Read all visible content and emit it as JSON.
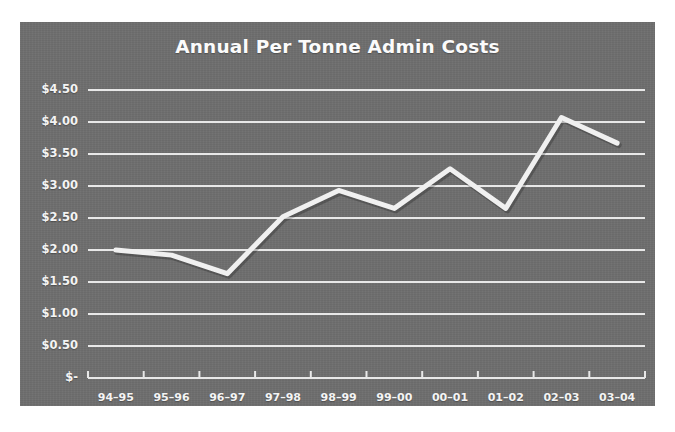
{
  "figure": {
    "background_color": "#ffffff",
    "panel_color": "#6f6f6f",
    "line_color": "#f0f0f0",
    "grid_color": "#e8e8e8",
    "text_color": "#f4f4f4"
  },
  "chart_data": {
    "type": "line",
    "title": "Annual Per Tonne Admin Costs",
    "xlabel": "",
    "ylabel": "",
    "categories": [
      "94–95",
      "95–96",
      "96–97",
      "97–98",
      "98–99",
      "99–00",
      "00–01",
      "01–02",
      "02–03",
      "03–04"
    ],
    "values": [
      2.0,
      1.92,
      1.63,
      2.52,
      2.93,
      2.65,
      3.27,
      2.65,
      4.07,
      3.67
    ],
    "series": [
      {
        "name": "Annual Per Tonne Admin Costs",
        "values": [
          2.0,
          1.92,
          1.63,
          2.52,
          2.93,
          2.65,
          3.27,
          2.65,
          4.07,
          3.67
        ]
      }
    ],
    "ylim": [
      0,
      4.5
    ],
    "yticks": [
      0,
      0.5,
      1.0,
      1.5,
      2.0,
      2.5,
      3.0,
      3.5,
      4.0,
      4.5
    ],
    "ytick_labels": [
      "$-",
      "$0.50",
      "$1.00",
      "$1.50",
      "$2.00",
      "$2.50",
      "$3.00",
      "$3.50",
      "$4.00",
      "$4.50"
    ],
    "grid": "horizontal",
    "legend": "none",
    "line_width": 5,
    "markers": "none"
  }
}
